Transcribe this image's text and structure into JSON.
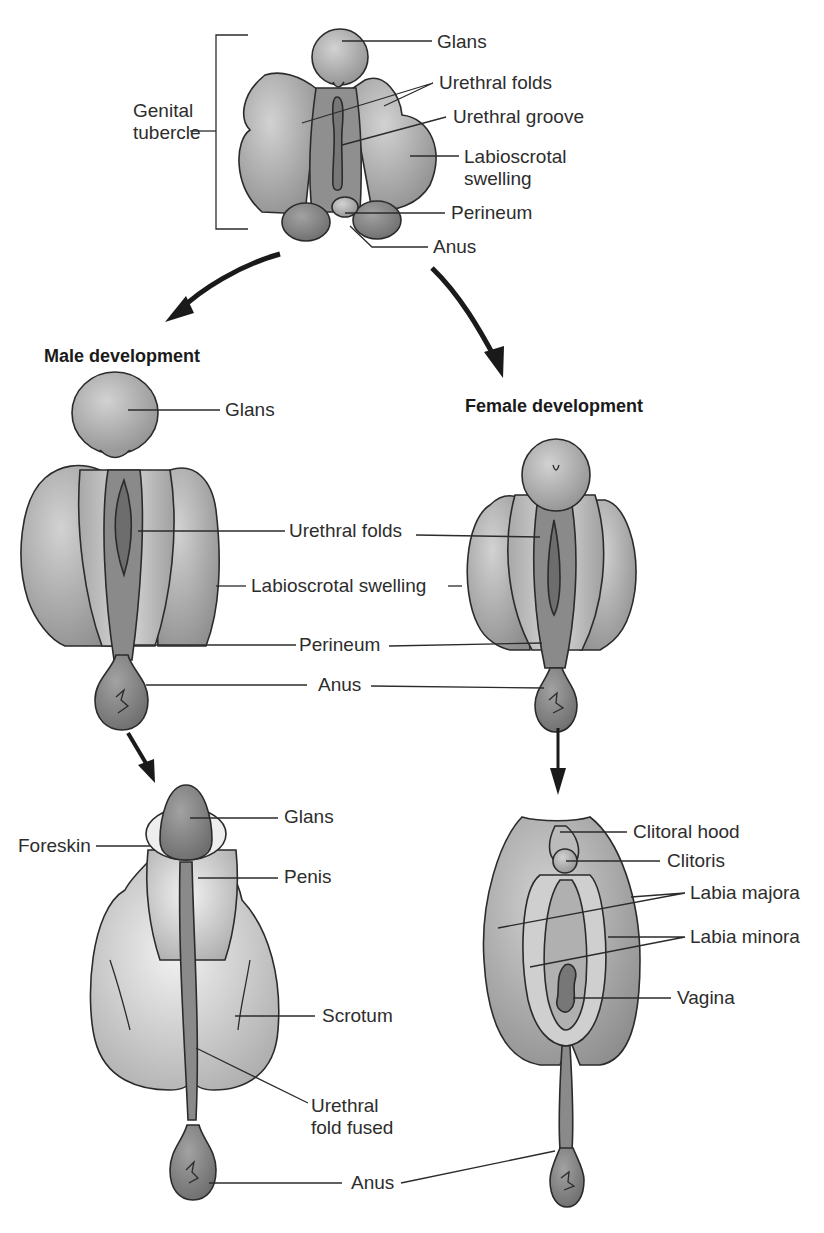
{
  "figure": {
    "colors": {
      "dark_tissue": "#7d7d7d",
      "mid_tissue": "#a3a3a3",
      "light_tissue": "#c9c9c9",
      "pale_tissue": "#e2e2e2",
      "outline": "#2b2b2b",
      "background": "#ffffff"
    },
    "indifferent_stage": {
      "bracket_label_line1": "Genital",
      "bracket_label_line2": "tubercle",
      "labels": {
        "glans": "Glans",
        "urethral_folds": "Urethral folds",
        "urethral_groove": "Urethral groove",
        "labioscrotal_line1": "Labioscrotal",
        "labioscrotal_line2": "swelling",
        "perineum": "Perineum",
        "anus": "Anus"
      }
    },
    "headings": {
      "male": "Male development",
      "female": "Female development"
    },
    "intermediate_stage": {
      "labels": {
        "glans": "Glans",
        "urethral_folds": "Urethral folds",
        "labioscrotal_swelling": "Labioscrotal swelling",
        "perineum": "Perineum",
        "anus": "Anus"
      }
    },
    "male_final": {
      "labels": {
        "foreskin": "Foreskin",
        "glans": "Glans",
        "penis": "Penis",
        "scrotum": "Scrotum",
        "urethral_fold_line1": "Urethral",
        "urethral_fold_line2": "fold fused",
        "anus": "Anus"
      }
    },
    "female_final": {
      "labels": {
        "clitoral_hood": "Clitoral hood",
        "clitoris": "Clitoris",
        "labia_majora": "Labia majora",
        "labia_minora": "Labia minora",
        "vagina": "Vagina"
      }
    }
  }
}
